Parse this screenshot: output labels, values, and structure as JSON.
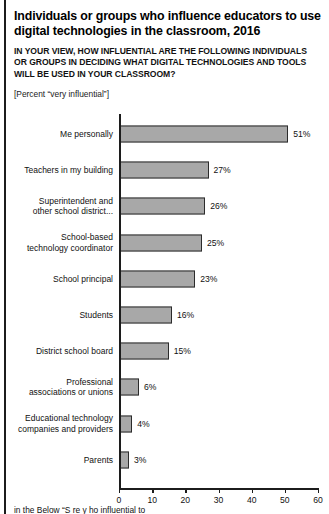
{
  "header": {
    "title": "Individuals or groups who influence educators to use digital technologies in the classroom, 2016",
    "subtitle": "IN YOUR VIEW, HOW INFLUENTIAL ARE THE FOLLOWING INDIVIDUALS OR GROUPS IN DECIDING WHAT DIGITAL TECHNOLOGIES AND TOOLS WILL BE USED IN YOUR CLASSROOM?",
    "unit_note": "[Percent “very influential”]"
  },
  "footnote": "in the Below “S  re  y  ho  influential to",
  "colors": {
    "bar_fill": "#a8a8a8",
    "bar_border": "#2b2b2b",
    "axis": "#1c1c1c",
    "text": "#111111",
    "background": "#ffffff"
  },
  "chart_data": {
    "type": "bar",
    "orientation": "horizontal",
    "title": "Individuals or groups who influence educators to use digital technologies in the classroom, 2016",
    "subtitle": "IN YOUR VIEW, HOW INFLUENTIAL ARE THE FOLLOWING INDIVIDUALS OR GROUPS IN DECIDING WHAT DIGITAL TECHNOLOGIES AND TOOLS WILL BE USED IN YOUR CLASSROOM?",
    "xlabel": "",
    "ylabel": "",
    "xlim": [
      0,
      60
    ],
    "xticks": [
      0,
      10,
      20,
      30,
      40,
      50,
      60
    ],
    "xtick_labels": [
      "0",
      "10",
      "20",
      "30",
      "40",
      "50",
      "60"
    ],
    "grid": false,
    "legend": false,
    "value_suffix": "%",
    "categories": [
      "Me personally",
      "Teachers in my building",
      "Superintendent and other school district...",
      "School-based technology coordinator",
      "School principal",
      "Students",
      "District school board",
      "Professional associations or unions",
      "Educational technology companies and providers",
      "Parents"
    ],
    "values": [
      51,
      27,
      26,
      25,
      23,
      16,
      15,
      6,
      4,
      3
    ],
    "value_labels": [
      "51%",
      "27%",
      "26%",
      "25%",
      "23%",
      "16%",
      "15%",
      "6%",
      "4%",
      "3%"
    ],
    "category_lines": [
      [
        "Me personally"
      ],
      [
        "Teachers in my building"
      ],
      [
        "Superintendent and",
        "other school district..."
      ],
      [
        "School-based",
        "technology coordinator"
      ],
      [
        "School principal"
      ],
      [
        "Students"
      ],
      [
        "District school board"
      ],
      [
        "Professional",
        "associations or unions"
      ],
      [
        "Educational technology",
        "companies and providers"
      ],
      [
        "Parents"
      ]
    ]
  }
}
